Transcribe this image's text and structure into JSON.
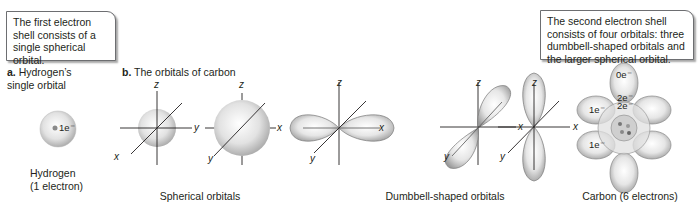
{
  "callouts": {
    "first_shell": "The first electron shell consists of a single spherical orbital.",
    "second_shell": "The second electron shell consists of four orbitals: three dumbbell-shaped orbitals and the larger spherical orbital."
  },
  "panel_a": {
    "letter": "a.",
    "title": "Hydrogen’s single orbital",
    "electron_label": "1e⁻",
    "caption_line1": "Hydrogen",
    "caption_line2": "(1 electron)"
  },
  "panel_b": {
    "letter": "b.",
    "title": "The orbitals of carbon",
    "spherical_caption": "Spherical orbitals",
    "dumbbell_caption": "Dumbbell-shaped orbitals",
    "carbon_caption": "Carbon (6 electrons)",
    "axes": {
      "x": "x",
      "y": "y",
      "z": "z"
    },
    "carbon_labels": [
      "0e⁻",
      "2e⁻",
      "2e⁻",
      "1e⁻",
      "1e⁻"
    ]
  },
  "colors": {
    "orbital_fill": "#d9d9d9",
    "orbital_edge": "#8a8a8a",
    "axis": "#231f20",
    "border": "#6d6e71"
  }
}
